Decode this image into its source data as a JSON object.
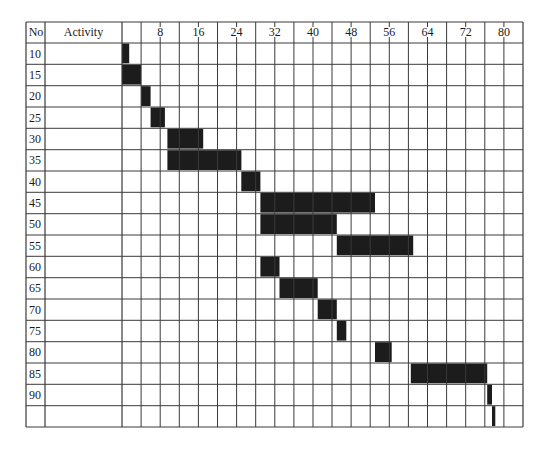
{
  "header": {
    "no_label": "No",
    "activity_label": "Activity"
  },
  "chart_data": {
    "type": "gantt",
    "title": "",
    "xlabel": "",
    "ylabel": "No",
    "x_tick_labels": [
      "8",
      "16",
      "24",
      "32",
      "40",
      "48",
      "56",
      "64",
      "72",
      "80"
    ],
    "x_ticks": [
      8,
      16,
      24,
      32,
      40,
      48,
      56,
      64,
      72,
      80
    ],
    "xlim": [
      0,
      84
    ],
    "grid_step": 4,
    "grid": true,
    "columns": [
      "No",
      "Activity"
    ],
    "rows": [
      {
        "no": "10",
        "activity": "",
        "start": 0,
        "end": 1.5
      },
      {
        "no": "15",
        "activity": "",
        "start": 0,
        "end": 4
      },
      {
        "no": "20",
        "activity": "",
        "start": 4,
        "end": 6
      },
      {
        "no": "25",
        "activity": "",
        "start": 6,
        "end": 9
      },
      {
        "no": "30",
        "activity": "",
        "start": 9.5,
        "end": 17
      },
      {
        "no": "35",
        "activity": "",
        "start": 9.5,
        "end": 25
      },
      {
        "no": "40",
        "activity": "",
        "start": 25,
        "end": 29
      },
      {
        "no": "45",
        "activity": "",
        "start": 29,
        "end": 53
      },
      {
        "no": "50",
        "activity": "",
        "start": 29,
        "end": 45
      },
      {
        "no": "55",
        "activity": "",
        "start": 45,
        "end": 61
      },
      {
        "no": "60",
        "activity": "",
        "start": 29,
        "end": 33
      },
      {
        "no": "65",
        "activity": "",
        "start": 33,
        "end": 41
      },
      {
        "no": "70",
        "activity": "",
        "start": 41,
        "end": 45
      },
      {
        "no": "75",
        "activity": "",
        "start": 45,
        "end": 47
      },
      {
        "no": "80",
        "activity": "",
        "start": 53,
        "end": 56.5
      },
      {
        "no": "85",
        "activity": "",
        "start": 60.5,
        "end": 76.5
      },
      {
        "no": "90",
        "activity": "",
        "start": 76.5,
        "end": 77.5
      },
      {
        "no": "",
        "activity": "",
        "start": 77.5,
        "end": 78.2
      }
    ],
    "colors": {
      "bar": "#1c1c1c",
      "grid": "#3a3a3a",
      "background": "#ffffff"
    }
  }
}
